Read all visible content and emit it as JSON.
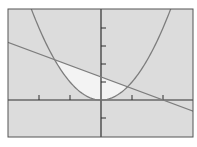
{
  "chart_data": {
    "type": "line",
    "title": "",
    "xlabel": "",
    "ylabel": "",
    "xlim": [
      -3.0,
      3.0
    ],
    "ylim": [
      -2.0,
      5.0
    ],
    "grid": false,
    "legend": null,
    "x_ticks": [
      -2,
      -1,
      1,
      2
    ],
    "y_ticks": [
      -1,
      1,
      2,
      3,
      4
    ],
    "series": [
      {
        "name": "parabola",
        "equation": "y = x^2",
        "color": "#7d7d7d"
      },
      {
        "name": "line",
        "equation": "y = -0.64x + 1.28",
        "color": "#7d7d7d"
      }
    ],
    "shaded_region": {
      "between": [
        "line",
        "parabola"
      ],
      "x_from": -1.5,
      "x_to": 0.86,
      "color": "#f3f3f3"
    },
    "intersections": [
      [
        -1.5,
        2.25
      ],
      [
        0.86,
        0.73
      ]
    ]
  },
  "colors": {
    "background": "#dcdcdc",
    "frame": "#555555",
    "axes": "#2e2e2e",
    "curve": "#7d7d7d",
    "shade": "#f3f3f3"
  }
}
